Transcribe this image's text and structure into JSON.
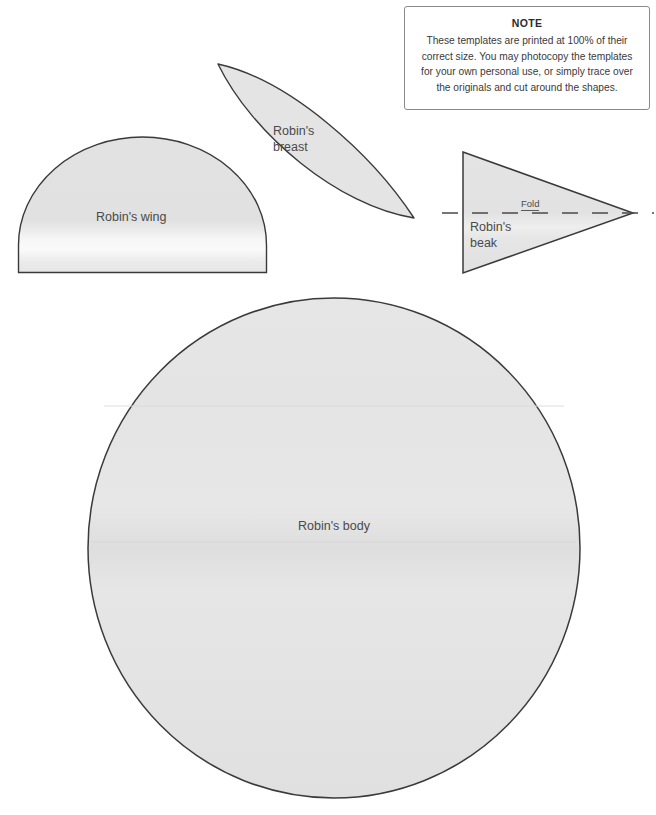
{
  "page": {
    "kind": "craft-template-sheet",
    "background_color": "#ffffff",
    "shape_fill_color": "#e3e3e3",
    "shape_stroke_color": "#3a3a3a",
    "label_text_color": "#4a4a4a"
  },
  "note": {
    "title": "NOTE",
    "body": "These templates are printed at 100% of their correct size. You may photocopy the templates for your own personal use, or simply trace over the originals and cut around the shapes."
  },
  "shapes": {
    "wing": {
      "label": "Robin's wing",
      "form": "half-ellipse-dome"
    },
    "breast": {
      "label": "Robin's\nbreast",
      "form": "leaf-vesica"
    },
    "beak": {
      "label": "Robin's\nbeak",
      "form": "triangle",
      "fold_label": "Fold"
    },
    "body": {
      "label": "Robin's body",
      "form": "circle"
    }
  }
}
